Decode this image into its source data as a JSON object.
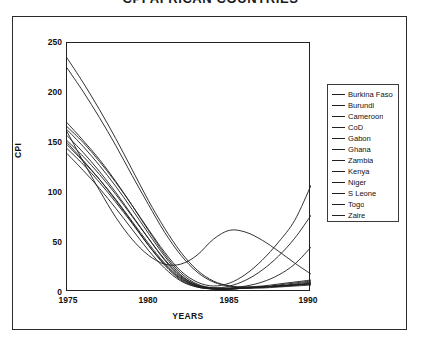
{
  "chart_data": {
    "type": "line",
    "title": "CPI AFRICAN COUNTRIES",
    "xlabel": "YEARS",
    "ylabel": "CPI",
    "xlim": [
      1975,
      1990
    ],
    "ylim": [
      0,
      250
    ],
    "xticks": [
      "1975",
      "1980",
      "1985",
      "1990"
    ],
    "yticks": [
      "0",
      "50",
      "100",
      "150",
      "200",
      "250"
    ],
    "grid": false,
    "legend_position": "right",
    "x": [
      1975,
      1976,
      1977,
      1978,
      1979,
      1980,
      1981,
      1982,
      1983,
      1984,
      1985,
      1986,
      1987,
      1988,
      1989,
      1990
    ],
    "series": [
      {
        "name": "Burkina Faso",
        "values": [
          150,
          132,
          113,
          92,
          70,
          47,
          27,
          12,
          5,
          3,
          3,
          4,
          5,
          6,
          7,
          8
        ]
      },
      {
        "name": "Burundi",
        "values": [
          157,
          140,
          121,
          100,
          77,
          54,
          32,
          15,
          6,
          3,
          3,
          4,
          5,
          6,
          7,
          9
        ]
      },
      {
        "name": "Cameroon",
        "values": [
          235,
          210,
          183,
          154,
          123,
          92,
          64,
          40,
          22,
          11,
          6,
          4,
          4,
          5,
          6,
          7
        ]
      },
      {
        "name": "CoD",
        "values": [
          163,
          146,
          127,
          106,
          83,
          59,
          36,
          17,
          7,
          3,
          3,
          4,
          5,
          7,
          9,
          11
        ]
      },
      {
        "name": "Gabon",
        "values": [
          225,
          201,
          175,
          147,
          117,
          88,
          60,
          37,
          20,
          10,
          6,
          5,
          5,
          6,
          7,
          8
        ]
      },
      {
        "name": "Ghana",
        "values": [
          170,
          152,
          133,
          111,
          87,
          62,
          38,
          19,
          8,
          4,
          3,
          4,
          5,
          6,
          8,
          10
        ]
      },
      {
        "name": "Zambia",
        "values": [
          144,
          128,
          110,
          90,
          69,
          47,
          28,
          13,
          6,
          4,
          6,
          12,
          22,
          36,
          54,
          77
        ]
      },
      {
        "name": "Kenya",
        "values": [
          166,
          150,
          131,
          110,
          87,
          63,
          40,
          21,
          10,
          6,
          9,
          18,
          32,
          50,
          72,
          107
        ]
      },
      {
        "name": "Niger",
        "values": [
          139,
          122,
          104,
          84,
          63,
          42,
          24,
          11,
          5,
          3,
          3,
          4,
          5,
          6,
          7,
          9
        ]
      },
      {
        "name": "S Leone",
        "values": [
          152,
          136,
          118,
          98,
          76,
          54,
          33,
          16,
          7,
          4,
          4,
          6,
          10,
          17,
          28,
          45
        ]
      },
      {
        "name": "Togo",
        "values": [
          148,
          131,
          113,
          93,
          71,
          49,
          29,
          14,
          6,
          4,
          4,
          5,
          6,
          8,
          10,
          12
        ]
      },
      {
        "name": "Zaire",
        "values": [
          161,
          131,
          102,
          75,
          53,
          37,
          28,
          28,
          37,
          53,
          62,
          60,
          52,
          41,
          29,
          18
        ]
      }
    ]
  },
  "legend": {
    "items": [
      {
        "label": "Burkina Faso"
      },
      {
        "label": "Burundi"
      },
      {
        "label": "Cameroon"
      },
      {
        "label": "CoD"
      },
      {
        "label": "Gabon"
      },
      {
        "label": "Ghana"
      },
      {
        "label": "Zambia"
      },
      {
        "label": "Kenya"
      },
      {
        "label": "Niger"
      },
      {
        "label": "S Leone"
      },
      {
        "label": "Togo"
      },
      {
        "label": "Zaire"
      }
    ]
  }
}
